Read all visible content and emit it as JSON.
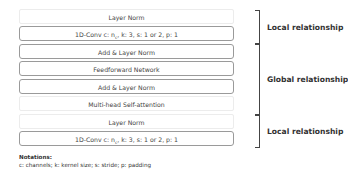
{
  "blocks": [
    {
      "label": "Layer Norm",
      "style": "soft"
    },
    {
      "label": "1D-Conv    c: n",
      "sub": "c",
      "rest": ", k: 3, s: 1 or 2, p: 1",
      "style": "hard"
    },
    {
      "label": "Add & Layer Norm",
      "style": "hard"
    },
    {
      "label": "Feedforward Network",
      "style": "hard"
    },
    {
      "label": "Add & Layer Norm",
      "style": "hard"
    },
    {
      "label": "Multi-head Self-attention",
      "style": "soft"
    },
    {
      "label": "Layer Norm",
      "style": "soft"
    },
    {
      "label": "1D-Conv    c: n",
      "sub": "c",
      "rest": ", k: 3, s: 1 or 2, p: 1",
      "style": "hard"
    }
  ],
  "groups": [
    {
      "label": "Local relationship"
    },
    {
      "label": "Global relationship"
    },
    {
      "label": "Local relationship"
    }
  ],
  "notations": {
    "title": "Notations:",
    "text": "c: channels; k: kernel size; s: stride; p: padding"
  }
}
